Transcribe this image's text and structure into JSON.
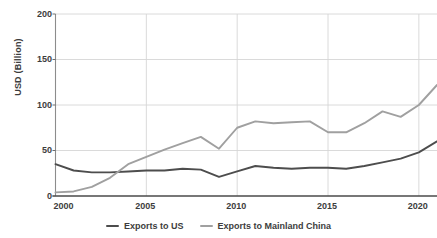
{
  "chart_data": {
    "type": "line",
    "title": "",
    "title_note": "chart title is cropped off the top edge of the screenshot",
    "xlabel": "",
    "ylabel": "USD (Billion)",
    "xlim": [
      2000,
      2021
    ],
    "ylim": [
      0,
      200
    ],
    "yticks": [
      0,
      50,
      100,
      150,
      200
    ],
    "xticks": [
      2000,
      2005,
      2010,
      2015,
      2020
    ],
    "ytick_labels": [
      "0",
      "50",
      "100",
      "150",
      "200"
    ],
    "xtick_labels": [
      "2000",
      "2005",
      "2010",
      "2015",
      "2020"
    ],
    "grid": "horizontal-and-vertical",
    "legend_position": "bottom-center",
    "x": [
      2000,
      2001,
      2002,
      2003,
      2004,
      2005,
      2006,
      2007,
      2008,
      2009,
      2010,
      2011,
      2012,
      2013,
      2014,
      2015,
      2016,
      2017,
      2018,
      2019,
      2020,
      2021
    ],
    "series": [
      {
        "name": "Exports to US",
        "color": "#4d4d4d",
        "values": [
          35,
          28,
          26,
          26,
          27,
          28,
          28,
          30,
          29,
          21,
          27,
          33,
          31,
          30,
          31,
          31,
          30,
          33,
          37,
          41,
          48,
          60
        ]
      },
      {
        "name": "Exports to Mainland China",
        "color": "#a0a0a0",
        "values": [
          4,
          5,
          10,
          20,
          35,
          43,
          51,
          58,
          65,
          52,
          75,
          82,
          80,
          81,
          82,
          70,
          70,
          80,
          93,
          87,
          100,
          122
        ]
      }
    ]
  },
  "axis": {
    "y_label": "USD (Billion)"
  },
  "legend": {
    "items": [
      {
        "label": "Exports to US",
        "color": "#4d4d4d"
      },
      {
        "label": "Exports to Mainland China",
        "color": "#a0a0a0"
      }
    ]
  }
}
